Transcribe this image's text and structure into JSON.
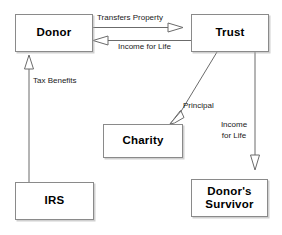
{
  "diagram": {
    "background_color": "#ffffff",
    "line_color": "#6b6b6b",
    "box_border_color": "#8a8a8a",
    "text_color": "#000000",
    "nodes": [
      {
        "id": "donor",
        "label": "Donor",
        "x": 15,
        "y": 14,
        "w": 78,
        "h": 38
      },
      {
        "id": "trust",
        "label": "Trust",
        "x": 191,
        "y": 14,
        "w": 78,
        "h": 38
      },
      {
        "id": "charity",
        "label": "Charity",
        "x": 103,
        "y": 124,
        "w": 80,
        "h": 34
      },
      {
        "id": "irs",
        "label": "IRS",
        "x": 15,
        "y": 182,
        "w": 79,
        "h": 38
      },
      {
        "id": "survivor",
        "label": "Donor's\nSurvivor",
        "x": 191,
        "y": 179,
        "w": 77,
        "h": 38
      }
    ],
    "edges": [
      {
        "id": "transfers-property",
        "label": "Transfers Property",
        "from": "donor",
        "to": "trust",
        "direction": "right"
      },
      {
        "id": "income-for-life",
        "label": "Income for Life",
        "from": "trust",
        "to": "donor",
        "direction": "left"
      },
      {
        "id": "tax-benefits",
        "label": "Tax Benefits",
        "from": "irs",
        "to": "donor",
        "direction": "up"
      },
      {
        "id": "principal",
        "label": "Principal",
        "from": "trust",
        "to": "charity",
        "direction": "diagonal-down-left"
      },
      {
        "id": "income-for-life-survivor",
        "label": "Income\nfor Life",
        "from": "trust",
        "to": "survivor",
        "direction": "down"
      }
    ]
  }
}
